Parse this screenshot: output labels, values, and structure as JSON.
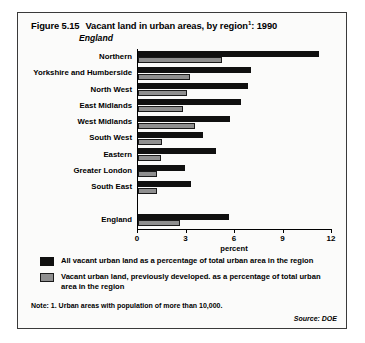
{
  "figure": {
    "number": "Figure 5.15",
    "title": "Vacant land in urban areas, by region",
    "title_superscript": "1",
    "title_suffix": ": 1990",
    "subtitle": "England"
  },
  "legend": {
    "items": [
      {
        "swatch": "dark",
        "color": "#101010",
        "label": "All vacant urban land as a percentage of total urban area in the region"
      },
      {
        "swatch": "light",
        "color": "#8f8f8f",
        "label": "Vacant urban land, previously developed. as a percentage of total urban area in the region"
      }
    ]
  },
  "footer": {
    "note": "Note: 1.  Urban areas with population of more than 10,000.",
    "source": "Source: DOE"
  },
  "chart_data": {
    "type": "bar",
    "orientation": "horizontal",
    "subtitle": "England",
    "xlabel": "percent",
    "ylabel": "",
    "xlim": [
      0,
      12
    ],
    "xticks": [
      0,
      3,
      6,
      9,
      12
    ],
    "xtick_labels": [
      "0",
      "3",
      "6",
      "9",
      "12"
    ],
    "grid": false,
    "legend_position": "below",
    "categories": [
      "Northern",
      "Yorkshire and Humberside",
      "North West",
      "East Midlands",
      "West Midlands",
      "South West",
      "Eastern",
      "Greater London",
      "South East",
      "",
      "England"
    ],
    "series": [
      {
        "name": "All vacant urban land as a percentage of total urban area in the region",
        "color": "#101010",
        "values": [
          11.2,
          7.0,
          6.8,
          6.4,
          5.7,
          4.0,
          4.8,
          2.9,
          3.3,
          null,
          5.6
        ]
      },
      {
        "name": "Vacant urban land, previously developed. as a percentage of total urban area in the region",
        "color": "#8f8f8f",
        "values": [
          5.2,
          3.2,
          3.0,
          2.8,
          3.5,
          1.5,
          1.4,
          1.2,
          1.2,
          null,
          2.6
        ]
      }
    ]
  }
}
